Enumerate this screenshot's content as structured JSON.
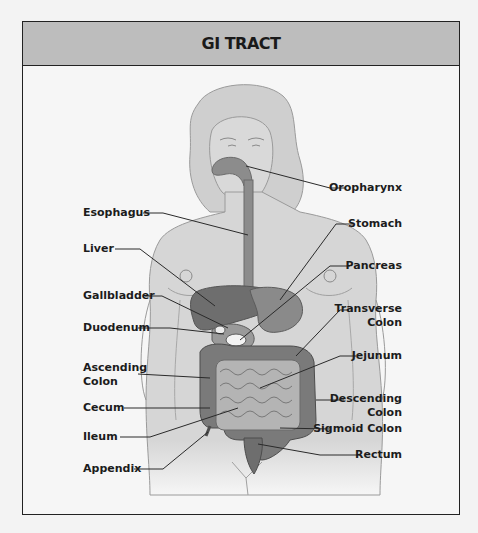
{
  "header": {
    "title": "GI TRACT"
  },
  "labels": {
    "left": [
      {
        "id": "esophagus",
        "text": "Esophagus"
      },
      {
        "id": "liver",
        "text": "Liver"
      },
      {
        "id": "gallbladder",
        "text": "Gallbladder"
      },
      {
        "id": "duodenum",
        "text": "Duodenum"
      },
      {
        "id": "ascending-colon",
        "line1": "Ascending",
        "line2": "Colon"
      },
      {
        "id": "cecum",
        "text": "Cecum"
      },
      {
        "id": "ileum",
        "text": "Ileum"
      },
      {
        "id": "appendix",
        "text": "Appendix"
      }
    ],
    "right": [
      {
        "id": "oropharynx",
        "text": "Oropharynx"
      },
      {
        "id": "stomach",
        "text": "Stomach"
      },
      {
        "id": "pancreas",
        "text": "Pancreas"
      },
      {
        "id": "transverse-colon",
        "line1": "Transverse",
        "line2": "Colon"
      },
      {
        "id": "jejunum",
        "text": "Jejunum"
      },
      {
        "id": "descending-colon",
        "line1": "Descending",
        "line2": "Colon"
      },
      {
        "id": "sigmoid-colon",
        "text": "Sigmoid Colon"
      },
      {
        "id": "rectum",
        "text": "Rectum"
      }
    ]
  },
  "colors": {
    "header_bg": "#bdbdbd",
    "body_fill": "#d6d6d6",
    "organ_dark": "#6e6e6e",
    "organ_mid": "#8c8c8c",
    "intestine_light": "#b4b4b4",
    "leader_line": "#2a2a2a"
  }
}
